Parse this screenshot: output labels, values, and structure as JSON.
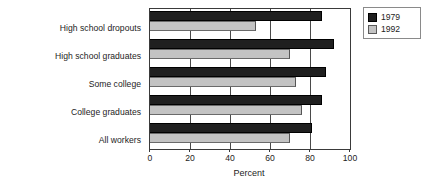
{
  "chart_data": {
    "type": "bar",
    "orientation": "horizontal",
    "title": "",
    "xlabel": "Percent",
    "ylabel": "",
    "xlim": [
      0,
      100
    ],
    "xticks": [
      0,
      20,
      40,
      60,
      80,
      100
    ],
    "xtick_labels": [
      "0",
      "20",
      "40",
      "60",
      "80",
      "100"
    ],
    "grid": true,
    "grid_axis": "x",
    "legend_position": "outside-top-right",
    "categories": [
      "High school dropouts",
      "High school graduates",
      "Some college",
      "College graduates",
      "All workers"
    ],
    "series": [
      {
        "name": "1979",
        "color": "#1f1f1f",
        "values": [
          86,
          92,
          88,
          86,
          81
        ]
      },
      {
        "name": "1992",
        "color": "#c3c3c3",
        "values": [
          53,
          70,
          73,
          76,
          70
        ]
      }
    ]
  },
  "legend": {
    "entries": [
      {
        "label": "1979",
        "swatch": "dark-swatch-icon"
      },
      {
        "label": "1992",
        "swatch": "light-swatch-icon"
      }
    ]
  },
  "axis": {
    "x_title": "Percent",
    "x_tick_labels": [
      "0",
      "20",
      "40",
      "60",
      "80",
      "100"
    ]
  }
}
